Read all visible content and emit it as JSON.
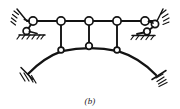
{
  "figure": {
    "caption": "(b)",
    "type": "structural-diagram",
    "stroke_color": "#131313",
    "background_color": "#ffffff",
    "joint_fill": "#ffffff"
  },
  "geometry": {
    "deck": {
      "y": 21,
      "x_start": 27,
      "x_end": 153,
      "joints_x": [
        33,
        61,
        89,
        117,
        145
      ],
      "joint_radius": 4.1
    },
    "hangers": [
      {
        "x": 61,
        "y_top": 21,
        "y_bottom": 50
      },
      {
        "x": 89,
        "y_top": 21,
        "y_bottom": 46
      },
      {
        "x": 117,
        "y_top": 21,
        "y_bottom": 50
      }
    ],
    "hanger_bottom_joints": [
      {
        "x": 61,
        "y": 50,
        "r": 3.0
      },
      {
        "x": 89,
        "y": 46,
        "r": 3.4
      },
      {
        "x": 117,
        "y": 50,
        "r": 3.0
      }
    ],
    "arch": {
      "left_base": {
        "x": 28,
        "y": 74
      },
      "right_base": {
        "x": 156,
        "y": 75
      },
      "apex": {
        "x": 90,
        "y": 47
      },
      "path": "M 28 74 Q 44 57 62 51 Q 90 45.5 118 51 Q 139 57 156 75"
    },
    "supports": {
      "deck_left": {
        "x": 24,
        "y": 21,
        "kind": "pin-on-hatched-wall"
      },
      "deck_left_lower": {
        "x": 33,
        "y": 33,
        "kind": "pin-on-hatched-ground"
      },
      "deck_right": {
        "x": 155,
        "y": 21,
        "kind": "pin-on-hatched-wall"
      },
      "deck_right_lower": {
        "x": 146,
        "y": 33,
        "kind": "pin-on-hatched-ground"
      },
      "arch_left_base": {
        "x": 28,
        "y": 74,
        "kind": "fixed-hatched"
      },
      "arch_right_base": {
        "x": 156,
        "y": 75,
        "kind": "fixed-hatched"
      }
    }
  }
}
